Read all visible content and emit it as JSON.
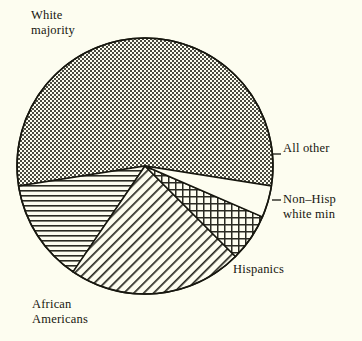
{
  "background_color": "#fdfdf0",
  "ink_color": "#17170f",
  "chart_data": {
    "type": "pie",
    "title": "",
    "subtitle": "",
    "xlabel": "",
    "ylabel": "",
    "legend_position": "none",
    "labels_position": "outside-callout",
    "grid": false,
    "total": 100,
    "units": "percent",
    "start_angle_deg": -9,
    "direction": "counterclockwise",
    "categories": [
      "White majority",
      "African Americans",
      "Hispanics",
      "Non-Hisp white min",
      "All other"
    ],
    "values": [
      55,
      13,
      22,
      6,
      4
    ],
    "slices": [
      {
        "label": "White majority",
        "label_lines": [
          "White",
          "majority"
        ],
        "value": 55,
        "start_angle_deg": -9,
        "end_angle_deg": 198,
        "fill_pattern": "checker-stipple",
        "fill_color": "#7d7d72"
      },
      {
        "label": "African Americans",
        "label_lines": [
          "African",
          "Americans"
        ],
        "value": 13,
        "start_angle_deg": 198,
        "end_angle_deg": 245,
        "fill_pattern": "horizontal-lines",
        "fill_color": "#2a2a22"
      },
      {
        "label": "Hispanics",
        "label_lines": [
          "Hispanics"
        ],
        "value": 22,
        "start_angle_deg": 245,
        "end_angle_deg": 324,
        "fill_pattern": "diagonal-hatch",
        "fill_color": "#2a2a22"
      },
      {
        "label": "Non-Hisp white min",
        "label_lines": [
          "Non–Hisp",
          "white min"
        ],
        "value": 6,
        "start_angle_deg": 324,
        "end_angle_deg": 348,
        "fill_pattern": "cross-hatch-grid",
        "fill_color": "#2a2a22"
      },
      {
        "label": "All other",
        "label_lines": [
          "All other"
        ],
        "value": 4,
        "start_angle_deg": 348,
        "end_angle_deg": 351,
        "fill_pattern": "blank",
        "fill_color": "#fdfdf0"
      }
    ]
  },
  "labels": {
    "white_majority_line1": "White",
    "white_majority_line2": "majority",
    "all_other": "All other",
    "nonhisp_line1": "Non–Hisp",
    "nonhisp_line2": "white min",
    "hispanics": "Hispanics",
    "african_line1": "African",
    "african_line2": "Americans"
  }
}
